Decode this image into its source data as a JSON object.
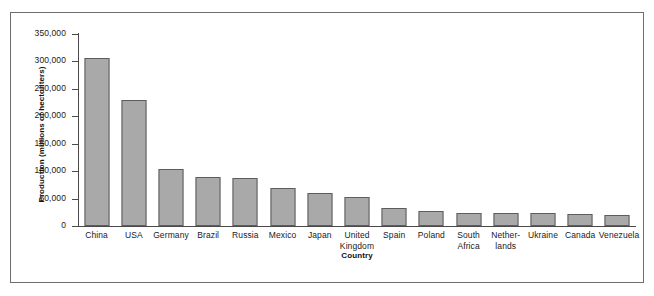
{
  "chart_data": {
    "type": "bar",
    "title": "",
    "xlabel": "Country",
    "ylabel": "Production (millions of hectoliters)",
    "categories": [
      "China",
      "USA",
      "Germany",
      "Brazil",
      "Russia",
      "Mexico",
      "Japan",
      "United Kingdom",
      "Spain",
      "Poland",
      "South Africa",
      "Netherlands",
      "Ukraine",
      "Canada",
      "Venezuela"
    ],
    "category_lines": [
      [
        "China"
      ],
      [
        "USA"
      ],
      [
        "Germany"
      ],
      [
        "Brazil"
      ],
      [
        "Russia"
      ],
      [
        "Mexico"
      ],
      [
        "Japan"
      ],
      [
        "United",
        "Kingdom"
      ],
      [
        "Spain"
      ],
      [
        "Poland"
      ],
      [
        "South",
        "Africa"
      ],
      [
        "Nether-",
        "lands"
      ],
      [
        "Ukraine"
      ],
      [
        "Canada"
      ],
      [
        "Venezuela"
      ]
    ],
    "values": [
      306000,
      229000,
      104000,
      89000,
      88000,
      70000,
      61000,
      53000,
      32000,
      28000,
      24500,
      24000,
      23000,
      22500,
      20500
    ],
    "ylim": [
      0,
      350000
    ],
    "ytick_values": [
      0,
      50000,
      100000,
      150000,
      200000,
      250000,
      300000,
      350000
    ],
    "ytick_labels": [
      "0",
      "50,000",
      "100,000",
      "150,000",
      "200,000",
      "250,000",
      "300,000",
      "350,000"
    ],
    "grid": false,
    "legend": null,
    "bar_color": "#a9a9a9",
    "bar_edge_color": "#5d5d5d",
    "axis_color": "#4a4a4a",
    "frame_color": "#6e6e6e",
    "background": "#ffffff"
  }
}
